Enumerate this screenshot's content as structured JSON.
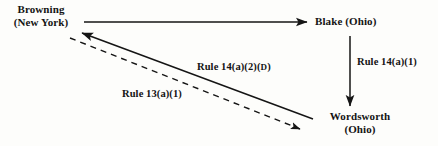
{
  "diagram": {
    "background_color": "#fdfdfb",
    "stroke_color": "#151515",
    "nodes": [
      {
        "id": "browning",
        "name": "Browning",
        "jurisdiction": "(New York)"
      },
      {
        "id": "blake",
        "name": "Blake (Ohio)",
        "jurisdiction": ""
      },
      {
        "id": "wordsworth",
        "name": "Wordsworth",
        "jurisdiction": "(Ohio)"
      }
    ],
    "edges": [
      {
        "id": "browning-to-blake",
        "from": "Browning",
        "to": "Blake",
        "style": "solid",
        "label": ""
      },
      {
        "id": "blake-to-wordsworth",
        "from": "Blake",
        "to": "Wordsworth",
        "style": "solid",
        "label": "Rule 14(a)(1)"
      },
      {
        "id": "wordsworth-to-browning",
        "from": "Wordsworth",
        "to": "Browning",
        "style": "solid",
        "label_prefix": "Rule 14(a)(",
        "label_bold": "2",
        "label_suffix": ")(",
        "label_smallcap": "D",
        "label_end": ")",
        "label": "Rule 14(a)(2)(D)"
      },
      {
        "id": "browning-to-wordsworth",
        "from": "Browning",
        "to": "Wordsworth",
        "style": "dashed",
        "label": "Rule 13(a)(1)"
      }
    ]
  }
}
